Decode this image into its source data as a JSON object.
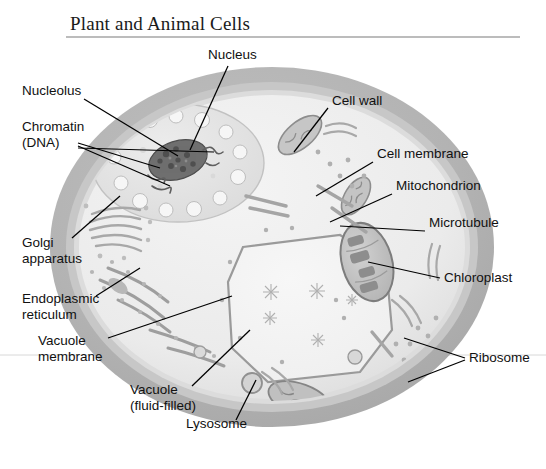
{
  "title": "Plant and Animal Cells",
  "figure": {
    "kind": "labeled-biology-diagram",
    "palette": {
      "background": "#ffffff",
      "cell_wall": "#b3b3b3",
      "cell_wall_inner": "#c9c9c9",
      "membrane_band": "#dedede",
      "cytoplasm": "#eeeeee",
      "nucleus": "#e3e3e3",
      "nucleolus": "#6a6a6a",
      "vacuole": "#f2f2f2",
      "organelle_outline": "#8f8f8f",
      "leader_line": "#000000",
      "title_rule": "#7a7a7a",
      "label_text": "#111111"
    }
  },
  "labels": [
    {
      "id": "nucleus",
      "text": "Nucleus",
      "lines": [
        "Nucleus"
      ],
      "x": 208,
      "y": 59,
      "anchor": "start"
    },
    {
      "id": "nucleolus",
      "text": "Nucleolus",
      "lines": [
        "Nucleolus"
      ],
      "x": 22,
      "y": 95,
      "anchor": "start"
    },
    {
      "id": "chromatin",
      "text": "Chromatin (DNA)",
      "lines": [
        "Chromatin",
        "(DNA)"
      ],
      "x": 22,
      "y": 131,
      "anchor": "start"
    },
    {
      "id": "golgi",
      "text": "Golgi apparatus",
      "lines": [
        "Golgi",
        "apparatus"
      ],
      "x": 22,
      "y": 247,
      "anchor": "start"
    },
    {
      "id": "endoplasmic",
      "text": "Endoplasmic reticulum",
      "lines": [
        "Endoplasmic",
        "reticulum"
      ],
      "x": 22,
      "y": 303,
      "anchor": "start"
    },
    {
      "id": "vacuole-membrane",
      "text": "Vacuole membrane",
      "lines": [
        "Vacuole",
        "membrane"
      ],
      "x": 38,
      "y": 345,
      "anchor": "start"
    },
    {
      "id": "vacuole",
      "text": "Vacuole (fluid-filled)",
      "lines": [
        "Vacuole",
        "(fluid-filled)"
      ],
      "x": 130,
      "y": 394,
      "anchor": "start"
    },
    {
      "id": "lysosome",
      "text": "Lysosome",
      "lines": [
        "Lysosome"
      ],
      "x": 186,
      "y": 428,
      "anchor": "start"
    },
    {
      "id": "cell-wall",
      "text": "Cell wall",
      "lines": [
        "Cell wall"
      ],
      "x": 332,
      "y": 105,
      "anchor": "start"
    },
    {
      "id": "cell-membrane",
      "text": "Cell membrane",
      "lines": [
        "Cell membrane"
      ],
      "x": 377,
      "y": 158,
      "anchor": "start"
    },
    {
      "id": "mitochondrion",
      "text": "Mitochondrion",
      "lines": [
        "Mitochondrion"
      ],
      "x": 396,
      "y": 190,
      "anchor": "start"
    },
    {
      "id": "microtubule",
      "text": "Microtubule",
      "lines": [
        "Microtubule"
      ],
      "x": 429,
      "y": 227,
      "anchor": "start"
    },
    {
      "id": "chloroplast",
      "text": "Chloroplast",
      "lines": [
        "Chloroplast"
      ],
      "x": 444,
      "y": 282,
      "anchor": "start"
    },
    {
      "id": "ribosome",
      "text": "Ribosome",
      "lines": [
        "Ribosome"
      ],
      "x": 469,
      "y": 362,
      "anchor": "start"
    }
  ]
}
